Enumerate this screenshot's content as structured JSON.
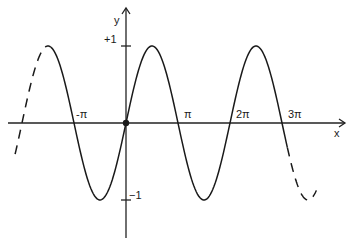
{
  "chart_data": {
    "type": "line",
    "title": "",
    "function": "y = sin(x)",
    "xlabel": "x",
    "ylabel": "y",
    "xlim": [
      -7.5,
      10.5
    ],
    "ylim": [
      -1.5,
      1.5
    ],
    "x_ticks": [
      {
        "value": -3.14159,
        "label": "-π"
      },
      {
        "value": 3.14159,
        "label": "π"
      },
      {
        "value": 6.28319,
        "label": "2π"
      },
      {
        "value": 9.42478,
        "label": "3π"
      }
    ],
    "y_ticks": [
      {
        "value": 1,
        "label": "+1"
      },
      {
        "value": -1,
        "label": "−1"
      }
    ],
    "series": [
      {
        "name": "sin(x)",
        "solid_range": [
          -4.55,
          9.75
        ],
        "dashed_extensions": [
          [
            -6.7,
            -4.55
          ],
          [
            9.75,
            11.5
          ]
        ],
        "points": [
          {
            "x": -4.712,
            "y": 1
          },
          {
            "x": -3.14159,
            "y": 0
          },
          {
            "x": -1.5708,
            "y": -1
          },
          {
            "x": 0,
            "y": 0
          },
          {
            "x": 1.5708,
            "y": 1
          },
          {
            "x": 3.14159,
            "y": 0
          },
          {
            "x": 4.712,
            "y": -1
          },
          {
            "x": 6.28319,
            "y": 0
          },
          {
            "x": 7.854,
            "y": 1
          },
          {
            "x": 9.42478,
            "y": 0
          },
          {
            "x": 10.996,
            "y": -1
          }
        ]
      }
    ],
    "origin_marker": {
      "x": 0,
      "y": 0
    },
    "grid": false,
    "legend": "none"
  }
}
